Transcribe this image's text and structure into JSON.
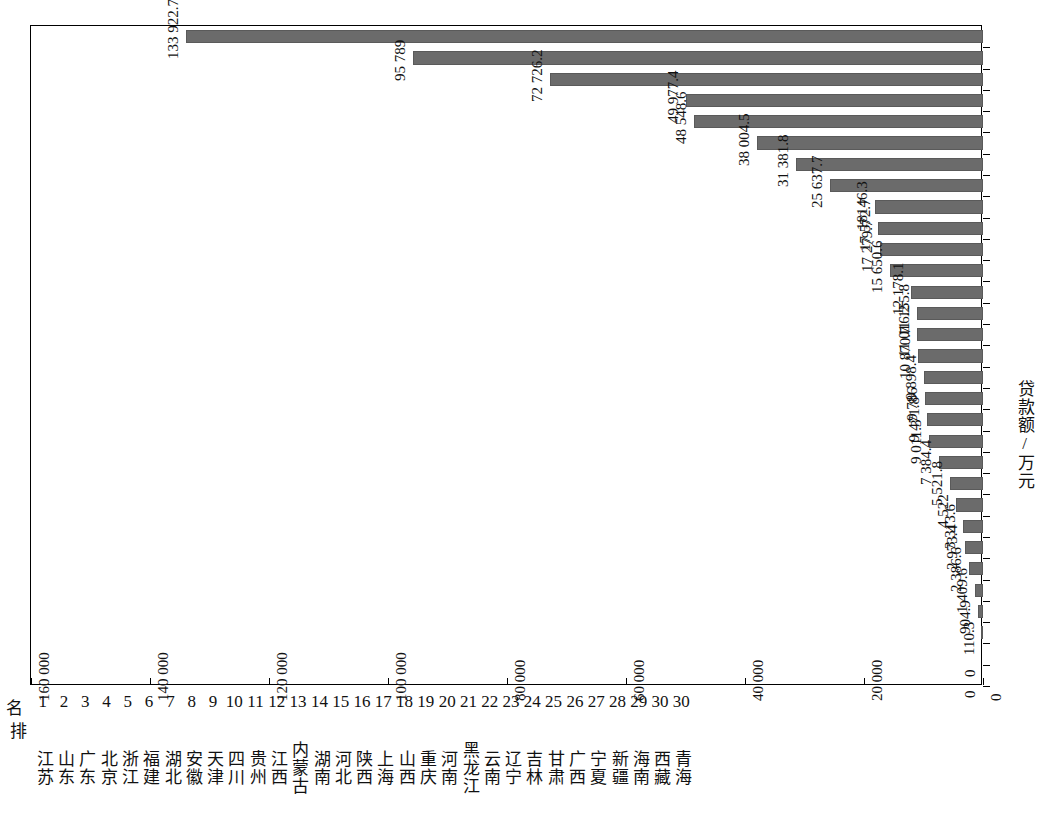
{
  "chart_data": {
    "type": "bar",
    "orientation": "rotated-vertical",
    "title": "",
    "xlabel": "排  名",
    "ylabel": "贷款额/万元",
    "axis_title": "贷款额/万元",
    "rank_header": "排  名",
    "grid": false,
    "legend": null,
    "ylim": [
      0,
      160000
    ],
    "ytick_labels": [
      "0",
      "20 000",
      "40 000",
      "60 000",
      "80 000",
      "100 000",
      "120 000",
      "140 000",
      "160 000"
    ],
    "ytick_values": [
      0,
      20000,
      40000,
      60000,
      80000,
      100000,
      120000,
      140000,
      160000
    ],
    "categories": [
      "江苏",
      "山东",
      "广东",
      "北京",
      "浙江",
      "福建",
      "湖北",
      "安徽",
      "天津",
      "四川",
      "贵州",
      "江西",
      "内蒙古",
      "湖南",
      "河北",
      "陕西",
      "上海",
      "山西",
      "重庆",
      "河南",
      "黑龙江",
      "云南",
      "辽宁",
      "吉林",
      "甘肃",
      "广西",
      "宁夏",
      "新疆",
      "海南",
      "西藏",
      "青海"
    ],
    "ranks": [
      "1",
      "2",
      "3",
      "4",
      "5",
      "6",
      "7",
      "8",
      "9",
      "10",
      "11",
      "12",
      "13",
      "14",
      "15",
      "16",
      "17",
      "18",
      "19",
      "20",
      "21",
      "22",
      "23",
      "24",
      "25",
      "26",
      "27",
      "28",
      "29",
      "30",
      "30"
    ],
    "values": [
      133922.7,
      95789,
      72726.2,
      49977.4,
      48548.6,
      38004.5,
      31381.8,
      25637.7,
      18146.3,
      17572.7,
      17279.7,
      15650.6,
      12178.1,
      11155.8,
      11016.2,
      10870.7,
      9898.4,
      9786,
      9471.8,
      9011.3,
      7384.4,
      5521.8,
      4522,
      3313.6,
      2973.4,
      2386.6,
      1409.6,
      904.9,
      110.3,
      0,
      0
    ],
    "value_labels": [
      "133 922.7",
      "95 789",
      "72 726.2",
      "49 977.4",
      "48 548.6",
      "38 004.5",
      "31 381.8",
      "25 637.7",
      "18146.3",
      "17 572.7",
      "17 279.7",
      "15 650.6",
      "12 178.1",
      "11 155.8",
      "11 016.2",
      "10 870.7",
      "9 898.4",
      "9 786",
      "9 471.8",
      "9 011.3",
      "7 384.4",
      "5 521.8",
      "4 522",
      "3 313.6",
      "2 973.4",
      "2 386.6",
      "1 409.6",
      "904.9",
      "110.3",
      "0",
      "0"
    ],
    "bar_color": "#6b6b6b",
    "frame_color": "#000000",
    "background_color": "#ffffff"
  }
}
